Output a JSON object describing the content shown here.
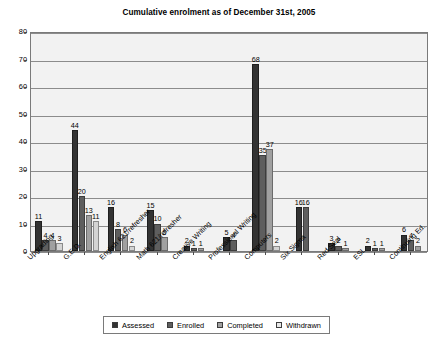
{
  "chart_data": {
    "type": "bar",
    "title": "Cumulative enrolment as of December 31st, 2005",
    "xlabel": "",
    "ylabel": "",
    "ylim": [
      0,
      80
    ],
    "ytick_step": 10,
    "ytick_labels": [
      "0",
      "10",
      "20",
      "30",
      "40",
      "50",
      "60",
      "70",
      "80"
    ],
    "grid": true,
    "legend_position": "bottom",
    "categories": [
      "Upgrading",
      "G.E.D.",
      "English 621/refresher",
      "Math 621/refresher",
      "Creative Writing",
      "Professional Writing",
      "Computers",
      "Six Sigma",
      "Red Seal",
      "ESL",
      "Continuing Ed."
    ],
    "series": [
      {
        "name": "Assessed",
        "color": "#333333",
        "values": [
          11,
          44,
          16,
          15,
          2,
          5,
          68,
          16,
          3,
          2,
          6
        ]
      },
      {
        "name": "Enrolled",
        "color": "#5e5e5e",
        "values": [
          4,
          20,
          8,
          10,
          1,
          4,
          35,
          16,
          2,
          1,
          4
        ]
      },
      {
        "name": "Completed",
        "color": "#a0a0a0",
        "values": [
          4,
          13,
          6,
          5,
          1,
          null,
          37,
          null,
          1,
          1,
          2
        ]
      },
      {
        "name": "Withdrawn",
        "color": "#d4d4d4",
        "values": [
          3,
          11,
          2,
          null,
          null,
          null,
          2,
          null,
          null,
          null,
          null
        ]
      }
    ],
    "data_labels": [
      [
        "11",
        "4",
        "4",
        "3"
      ],
      [
        "44",
        "20",
        "13",
        "11"
      ],
      [
        "16",
        "8",
        "6",
        "2"
      ],
      [
        "15",
        "10",
        "5",
        null
      ],
      [
        "2",
        "1",
        "1",
        null
      ],
      [
        "5",
        "4",
        null,
        null
      ],
      [
        "68",
        "35",
        "37",
        "2"
      ],
      [
        "16",
        "16",
        null,
        null
      ],
      [
        "3",
        "2",
        "1",
        null
      ],
      [
        "2",
        "1",
        "1",
        null
      ],
      [
        "6",
        "4",
        "2",
        null
      ]
    ]
  },
  "legend": {
    "items": [
      {
        "label": "Assessed"
      },
      {
        "label": "Enrolled"
      },
      {
        "label": "Completed"
      },
      {
        "label": "Withdrawn"
      }
    ]
  }
}
